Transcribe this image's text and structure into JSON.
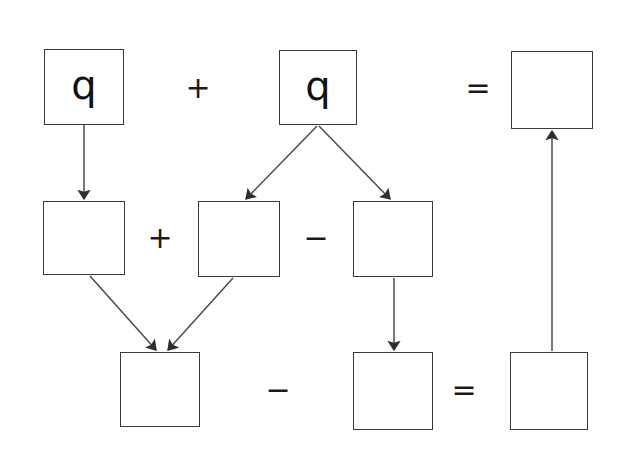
{
  "canvas": {
    "width": 625,
    "height": 452,
    "background": "#ffffff",
    "stroke_color": "#3a3a3c",
    "arrow_color": "#4a4a4c",
    "text_color": "#111214"
  },
  "diagram": {
    "type": "flow-diagram",
    "boxes": [
      {
        "id": "box-top-left",
        "label": "q",
        "x": 44,
        "y": 49,
        "w": 80,
        "h": 76,
        "row": "top",
        "filled": true
      },
      {
        "id": "box-top-middle",
        "label": "q",
        "x": 279,
        "y": 50,
        "w": 78,
        "h": 75,
        "row": "top",
        "filled": true
      },
      {
        "id": "box-top-right",
        "label": "",
        "x": 511,
        "y": 51,
        "w": 82,
        "h": 78,
        "row": "top",
        "filled": false
      },
      {
        "id": "box-mid-left",
        "label": "",
        "x": 43,
        "y": 201,
        "w": 82,
        "h": 74,
        "row": "middle",
        "filled": false
      },
      {
        "id": "box-mid-center",
        "label": "",
        "x": 198,
        "y": 201,
        "w": 82,
        "h": 76,
        "row": "middle",
        "filled": false
      },
      {
        "id": "box-mid-right",
        "label": "",
        "x": 353,
        "y": 201,
        "w": 80,
        "h": 76,
        "row": "middle",
        "filled": false
      },
      {
        "id": "box-bottom-left",
        "label": "",
        "x": 120,
        "y": 352,
        "w": 80,
        "h": 75,
        "row": "bottom",
        "filled": false
      },
      {
        "id": "box-bottom-center",
        "label": "",
        "x": 353,
        "y": 352,
        "w": 80,
        "h": 78,
        "row": "bottom",
        "filled": false
      },
      {
        "id": "box-bottom-right",
        "label": "",
        "x": 510,
        "y": 352,
        "w": 78,
        "h": 78,
        "row": "bottom",
        "filled": false
      }
    ],
    "operators": [
      {
        "id": "op-top-plus",
        "symbol": "+",
        "x": 198,
        "y": 88,
        "kind": "plus"
      },
      {
        "id": "op-top-equals",
        "symbol": "=",
        "x": 478,
        "y": 88,
        "kind": "equals"
      },
      {
        "id": "op-mid-plus",
        "symbol": "+",
        "x": 160,
        "y": 238,
        "kind": "plus"
      },
      {
        "id": "op-mid-minus",
        "symbol": "−",
        "x": 316,
        "y": 238,
        "kind": "minus"
      },
      {
        "id": "op-bottom-minus",
        "symbol": "−",
        "x": 278,
        "y": 390,
        "kind": "minus"
      },
      {
        "id": "op-bottom-equals",
        "symbol": "=",
        "x": 464,
        "y": 390,
        "kind": "equals"
      }
    ],
    "arrows": [
      {
        "id": "arrow-topleft-to-midleft",
        "x1": 84,
        "y1": 125,
        "x2": 84,
        "y2": 199,
        "from": "box-top-left",
        "to": "box-mid-left"
      },
      {
        "id": "arrow-topmiddle-to-midcenter",
        "x1": 317,
        "y1": 126,
        "x2": 246,
        "y2": 199,
        "from": "box-top-middle",
        "to": "box-mid-center"
      },
      {
        "id": "arrow-topmiddle-to-midright",
        "x1": 319,
        "y1": 126,
        "x2": 390,
        "y2": 199,
        "from": "box-top-middle",
        "to": "box-mid-right"
      },
      {
        "id": "arrow-midleft-to-bottomleft",
        "x1": 90,
        "y1": 276,
        "x2": 156,
        "y2": 350,
        "from": "box-mid-left",
        "to": "box-bottom-left"
      },
      {
        "id": "arrow-midcenter-to-bottomleft",
        "x1": 233,
        "y1": 278,
        "x2": 168,
        "y2": 350,
        "from": "box-mid-center",
        "to": "box-bottom-left"
      },
      {
        "id": "arrow-midright-to-bottomcenter",
        "x1": 394,
        "y1": 278,
        "x2": 394,
        "y2": 350,
        "from": "box-mid-right",
        "to": "box-bottom-center"
      },
      {
        "id": "arrow-bottomright-to-topright",
        "x1": 552,
        "y1": 351,
        "x2": 552,
        "y2": 131,
        "from": "box-bottom-right",
        "to": "box-top-right"
      }
    ]
  }
}
